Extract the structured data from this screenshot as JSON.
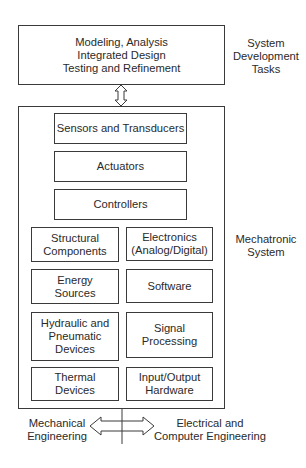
{
  "top_box": {
    "text": "Modeling, Analysis\nIntegrated Design\nTesting and Refinement"
  },
  "side_labels": {
    "tasks": "System\nDevelopment\nTasks",
    "system": "Mechatronic\nSystem"
  },
  "full_width_components": [
    {
      "label": "Sensors and Transducers"
    },
    {
      "label": "Actuators"
    },
    {
      "label": "Controllers"
    }
  ],
  "left_components": [
    {
      "label": "Structural\nComponents"
    },
    {
      "label": "Energy\nSources"
    },
    {
      "label": "Hydraulic and\nPneumatic\nDevices"
    },
    {
      "label": "Thermal\nDevices"
    }
  ],
  "right_components": [
    {
      "label": "Electronics\n(Analog/Digital)"
    },
    {
      "label": "Software"
    },
    {
      "label": "Signal\nProcessing"
    },
    {
      "label": "Input/Output\nHardware"
    }
  ],
  "bottom_labels": {
    "left": "Mechanical\nEngineering",
    "right": "Electrical and\nComputer Engineering"
  },
  "colors": {
    "line": "#3a3a3a",
    "text": "#2a2a2a",
    "background": "#ffffff"
  }
}
